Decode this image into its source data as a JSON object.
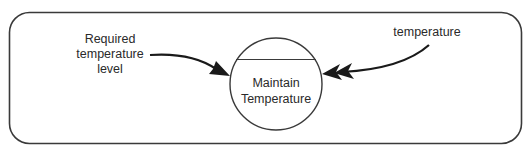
{
  "diagram": {
    "process": {
      "line1": "Maintain",
      "line2": "Temperature"
    },
    "inputs": [
      {
        "lines": [
          "Required",
          "temperature",
          "level"
        ],
        "arrow": "single"
      },
      {
        "lines": [
          "temperature"
        ],
        "arrow": "double"
      }
    ],
    "colors": {
      "stroke": "#3a3a3a",
      "arrow_fill": "#1a1a1a",
      "text": "#2a2a2a",
      "background": "#ffffff"
    }
  }
}
